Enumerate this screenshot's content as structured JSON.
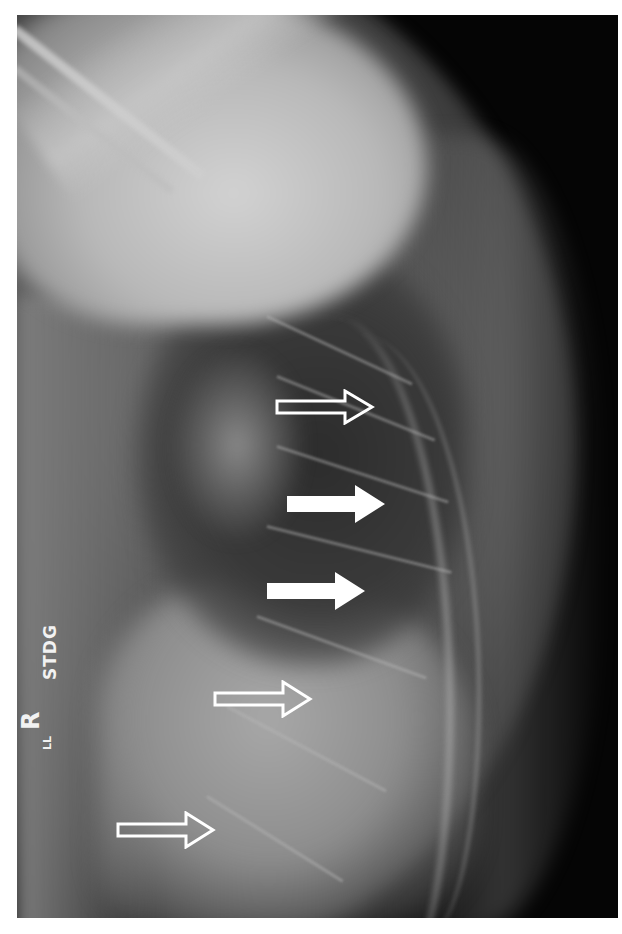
{
  "image": {
    "description": "Lateral thoracic spine radiograph with arrow annotations",
    "labels": {
      "technique": "STDG",
      "side_marker": "R",
      "side_marker_sub": "LL"
    },
    "annotations": [
      {
        "type": "outline-arrow",
        "direction": "right",
        "label": "vertebra-1"
      },
      {
        "type": "solid-arrow",
        "direction": "right",
        "label": "vertebra-2"
      },
      {
        "type": "solid-arrow",
        "direction": "right",
        "label": "vertebra-3"
      },
      {
        "type": "outline-arrow",
        "direction": "right",
        "label": "vertebra-4"
      },
      {
        "type": "outline-arrow",
        "direction": "right",
        "label": "vertebra-5"
      }
    ],
    "colors": {
      "border": "#ffffff",
      "background": "#050505",
      "arrow": "#ffffff"
    }
  }
}
